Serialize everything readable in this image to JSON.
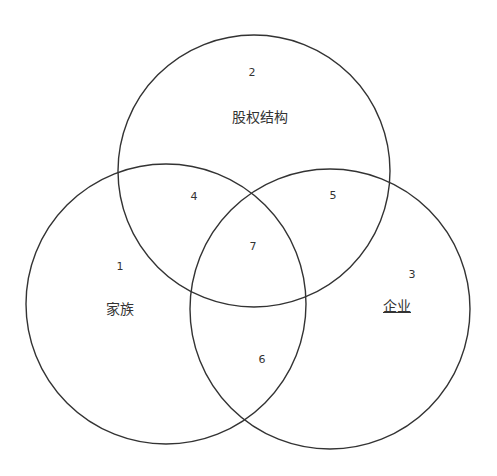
{
  "diagram": {
    "type": "venn",
    "stroke_color": "#333333",
    "sets": [
      {
        "id": 1,
        "name": "家族",
        "number": "1"
      },
      {
        "id": 2,
        "name": "股权结构",
        "number": "2"
      },
      {
        "id": 3,
        "name": "企业",
        "number": "3"
      }
    ],
    "regions": [
      {
        "number": "1",
        "sets": [
          "家族"
        ]
      },
      {
        "number": "2",
        "sets": [
          "股权结构"
        ]
      },
      {
        "number": "3",
        "sets": [
          "企业"
        ]
      },
      {
        "number": "4",
        "sets": [
          "家族",
          "股权结构"
        ]
      },
      {
        "number": "5",
        "sets": [
          "股权结构",
          "企业"
        ]
      },
      {
        "number": "6",
        "sets": [
          "家族",
          "企业"
        ]
      },
      {
        "number": "7",
        "sets": [
          "家族",
          "股权结构",
          "企业"
        ]
      }
    ],
    "labels": {
      "n1": "1",
      "n2": "2",
      "n3": "3",
      "n4": "4",
      "n5": "5",
      "n6": "6",
      "n7": "7",
      "family": "家族",
      "equity": "股权结构",
      "enterprise": "企业"
    }
  }
}
